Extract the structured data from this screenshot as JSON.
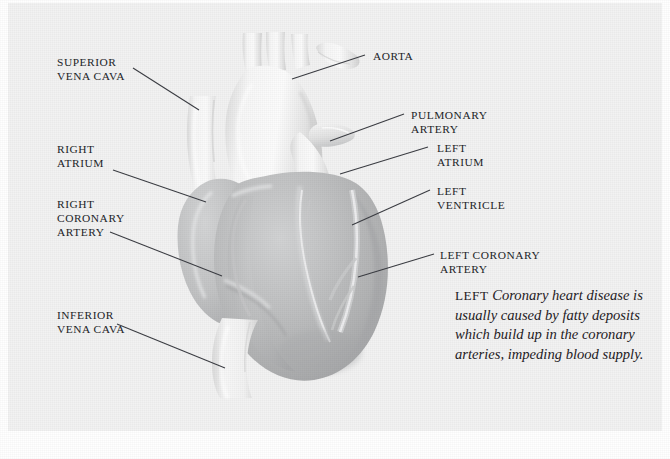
{
  "figure": {
    "background_color": "#f2f2f2",
    "page_color": "#ffffff",
    "label_color": "#222428",
    "leader_line_color": "#3a3c42",
    "heart_body_color": "#b9babb",
    "vessel_color": "#f4f4f4"
  },
  "labels": {
    "superior_vena_cava": "SUPERIOR\nVENA CAVA",
    "right_atrium": "RIGHT\nATRIUM",
    "right_coronary_artery": "RIGHT\nCORONARY\nARTERY",
    "inferior_vena_cava": "INFERIOR\nVENA CAVA",
    "aorta": "AORTA",
    "pulmonary_artery": "PULMONARY\nARTERY",
    "left_atrium": "LEFT\nATRIUM",
    "left_ventricle": "LEFT\nVENTRICLE",
    "left_coronary_artery": "LEFT CORONARY\nARTERY"
  },
  "caption": {
    "lead_word": "LEFT",
    "text": "Coronary heart disease is usually caused by fatty deposits which build up in the coronary arteries, impeding blood supply."
  }
}
